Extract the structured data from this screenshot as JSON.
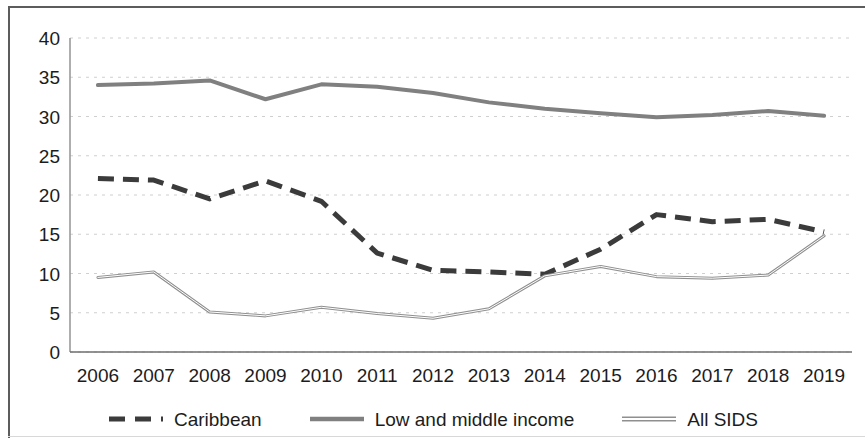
{
  "chart_data": {
    "type": "line",
    "title": "",
    "subtitle": "",
    "xlabel": "",
    "ylabel": "",
    "categories": [
      "2006",
      "2007",
      "2008",
      "2009",
      "2010",
      "2011",
      "2012",
      "2013",
      "2014",
      "2015",
      "2016",
      "2017",
      "2018",
      "2019"
    ],
    "x": [
      2006,
      2007,
      2008,
      2009,
      2010,
      2011,
      2012,
      2013,
      2014,
      2015,
      2016,
      2017,
      2018,
      2019
    ],
    "ylim": [
      0,
      40
    ],
    "y_ticks": [
      0,
      5,
      10,
      15,
      20,
      25,
      30,
      35,
      40
    ],
    "y_tick_labels": [
      "0",
      "5",
      "10",
      "15",
      "20",
      "25",
      "30",
      "35",
      "40"
    ],
    "grid": true,
    "grid_style": "dotted-horizontal",
    "legend_position": "bottom",
    "series": [
      {
        "name": "Caribbean",
        "style": "dashed",
        "color": "#3b3b3b",
        "width": 5,
        "values": [
          22.1,
          21.9,
          19.5,
          21.8,
          19.2,
          12.6,
          10.4,
          10.2,
          9.9,
          13.1,
          17.5,
          16.6,
          16.9,
          15.3
        ]
      },
      {
        "name": "Low and middle income",
        "style": "solid",
        "color": "#808080",
        "width": 4,
        "values": [
          34.0,
          34.2,
          34.6,
          32.2,
          34.1,
          33.8,
          33.0,
          31.8,
          31.0,
          30.4,
          29.9,
          30.2,
          30.7,
          30.1
        ]
      },
      {
        "name": "All SIDS",
        "style": "solid-thin-outline",
        "color": "#a8a8a8",
        "width": 3,
        "values": [
          9.5,
          10.2,
          5.1,
          4.6,
          5.7,
          4.9,
          4.3,
          5.5,
          9.7,
          10.9,
          9.6,
          9.4,
          9.8,
          14.8
        ]
      }
    ]
  },
  "legend": {
    "items": [
      {
        "label": "Caribbean",
        "icon": "dashed-line-swatch"
      },
      {
        "label": "Low and middle income",
        "icon": "solid-line-swatch"
      },
      {
        "label": "All SIDS",
        "icon": "thin-line-swatch"
      }
    ]
  },
  "axes": {
    "y_axis_name": "y-axis",
    "x_axis_name": "x-axis"
  }
}
